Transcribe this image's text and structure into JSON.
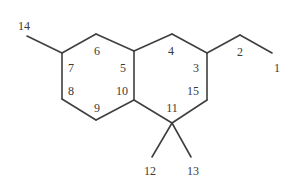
{
  "figure": {
    "kind": "chemical-structure-diagram",
    "background_color": "#ffffff",
    "bond_color": "#3f3f3f",
    "label_color": "#3a3a3a",
    "bond_width": 1.6
  },
  "atom_labels": [
    {
      "id": "label-1",
      "text": "1",
      "x": 277,
      "y": 68
    },
    {
      "id": "label-2",
      "text": "2",
      "x": 240,
      "y": 52
    },
    {
      "id": "label-3",
      "text": "3",
      "x": 196,
      "y": 68
    },
    {
      "id": "label-4",
      "text": "4",
      "x": 171,
      "y": 51
    },
    {
      "id": "label-5",
      "text": "5",
      "x": 123,
      "y": 68
    },
    {
      "id": "label-6",
      "text": "6",
      "x": 97,
      "y": 51
    },
    {
      "id": "label-7",
      "text": "7",
      "x": 71,
      "y": 68
    },
    {
      "id": "label-8",
      "text": "8",
      "x": 71,
      "y": 91
    },
    {
      "id": "label-9",
      "text": "9",
      "x": 97,
      "y": 108
    },
    {
      "id": "label-10",
      "text": "10",
      "x": 122,
      "y": 91
    },
    {
      "id": "label-11",
      "text": "11",
      "x": 172,
      "y": 108
    },
    {
      "id": "label-12",
      "text": "12",
      "x": 150,
      "y": 171
    },
    {
      "id": "label-13",
      "text": "13",
      "x": 193,
      "y": 171
    },
    {
      "id": "label-14",
      "text": "14",
      "x": 24,
      "y": 26
    },
    {
      "id": "label-15",
      "text": "15",
      "x": 193,
      "y": 91
    }
  ],
  "bonds": [
    {
      "id": "bond-1-2",
      "from": [
        272,
        53
      ],
      "to": [
        240,
        35
      ]
    },
    {
      "id": "bond-2-3",
      "from": [
        240,
        35
      ],
      "to": [
        207,
        53
      ]
    },
    {
      "id": "bond-3-4",
      "from": [
        207,
        53
      ],
      "to": [
        172,
        34
      ]
    },
    {
      "id": "bond-4-5",
      "from": [
        172,
        34
      ],
      "to": [
        134,
        51
      ]
    },
    {
      "id": "bond-5-6",
      "from": [
        134,
        51
      ],
      "to": [
        96,
        34
      ]
    },
    {
      "id": "bond-6-7",
      "from": [
        96,
        34
      ],
      "to": [
        62,
        53
      ]
    },
    {
      "id": "bond-7-14",
      "from": [
        62,
        53
      ],
      "to": [
        27,
        36
      ]
    },
    {
      "id": "bond-7-8",
      "from": [
        62,
        53
      ],
      "to": [
        62,
        99
      ]
    },
    {
      "id": "bond-8-9",
      "from": [
        62,
        99
      ],
      "to": [
        96,
        120
      ]
    },
    {
      "id": "bond-9-10",
      "from": [
        96,
        120
      ],
      "to": [
        134,
        100
      ]
    },
    {
      "id": "bond-10-5",
      "from": [
        134,
        100
      ],
      "to": [
        134,
        51
      ]
    },
    {
      "id": "bond-10-11",
      "from": [
        134,
        100
      ],
      "to": [
        172,
        123
      ]
    },
    {
      "id": "bond-11-15",
      "from": [
        172,
        123
      ],
      "to": [
        207,
        100
      ]
    },
    {
      "id": "bond-15-3",
      "from": [
        207,
        100
      ],
      "to": [
        207,
        53
      ]
    },
    {
      "id": "bond-11-12",
      "from": [
        172,
        123
      ],
      "to": [
        152,
        157
      ]
    },
    {
      "id": "bond-11-13",
      "from": [
        172,
        123
      ],
      "to": [
        191,
        157
      ]
    }
  ]
}
